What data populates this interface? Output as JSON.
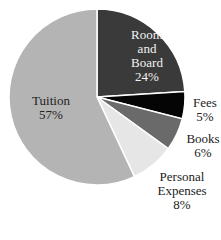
{
  "chart_data": {
    "type": "pie",
    "title": "",
    "start_angle_deg": 0,
    "direction": "clockwise",
    "slices": [
      {
        "label": "Room and Board",
        "value": 24,
        "display": "24%",
        "color": "#3a3a3a"
      },
      {
        "label": "Fees",
        "value": 5,
        "display": "5%",
        "color": "#050505"
      },
      {
        "label": "Books",
        "value": 6,
        "display": "6%",
        "color": "#6a6a6a"
      },
      {
        "label": "Personal Expenses",
        "value": 8,
        "display": "8%",
        "color": "#e6e6e6"
      },
      {
        "label": "Tuition",
        "value": 57,
        "display": "57%",
        "color": "#b4b4b4"
      }
    ]
  },
  "labels": {
    "room": {
      "l1": "Room",
      "l2": "and",
      "l3": "Board",
      "pct": "24%"
    },
    "fees": {
      "l1": "Fees",
      "pct": "5%"
    },
    "books": {
      "l1": "Books",
      "pct": "6%"
    },
    "personal": {
      "l1": "Personal",
      "l2": "Expenses",
      "pct": "8%"
    },
    "tuition": {
      "l1": "Tuition",
      "pct": "57%"
    }
  }
}
